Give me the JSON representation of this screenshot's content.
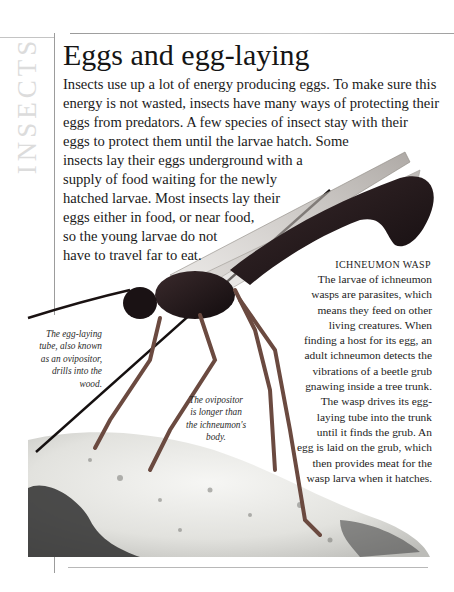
{
  "page": {
    "section_label": "INSECTS",
    "title": "Eggs and egg-laying",
    "intro_lines": [
      "Insects use up a lot of energy producing eggs. To make sure this",
      "energy is not wasted, insects have many ways of protecting their",
      "eggs from predators. A few species of insect stay with their",
      "eggs to protect them until the larvae hatch. Some",
      "insects lay their eggs underground with a",
      "supply of food waiting for the newly",
      "hatched larvae. Most insects lay their",
      "eggs either in food, or near food,",
      "so the young larvae do not",
      "have to travel far to eat."
    ]
  },
  "caption": {
    "heading": "Ichneumon wasp",
    "lines": [
      "The larvae of ichneumon",
      "wasps are parasites, which",
      "means they feed on other",
      "living creatures. When",
      "finding a host for its egg, an",
      "adult ichneumon detects the",
      "vibrations of a beetle grub",
      "gnawing inside a tree trunk.",
      "The wasp drives its egg-",
      "laying tube into the trunk",
      "until it finds the grub. An",
      "egg is laid on the grub, which",
      "then provides meat for the",
      "wasp larva when it hatches."
    ]
  },
  "annotations": {
    "ovipositor_drills": [
      "The egg-laying",
      "tube, also known",
      "as an ovipositor,",
      "drills into the",
      "wood."
    ],
    "ovipositor_longer": [
      "The ovipositor",
      "is longer than",
      "the ichneumon's",
      "body."
    ]
  },
  "image": {
    "subject": "ichneumon wasp on tree bark",
    "colors": {
      "body": "#1e1416",
      "legs": "#6b4a40",
      "wing": "#c9c4c0",
      "bark": "#e9e9e6",
      "bark_shadow": "#3a3a3a"
    }
  }
}
